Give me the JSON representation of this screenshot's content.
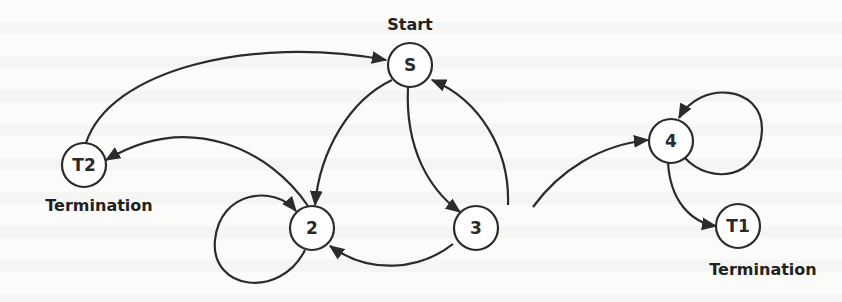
{
  "diagram": {
    "type": "state-transition",
    "colors": {
      "line": "#2b2b2b",
      "background": "#fbfbfa",
      "node_fill": "#ffffff"
    },
    "nodes": [
      {
        "id": "S",
        "label": "S",
        "caption": "Start",
        "caption_position": "above"
      },
      {
        "id": "T2",
        "label": "T2",
        "caption": "Termination",
        "caption_position": "below"
      },
      {
        "id": "2",
        "label": "2",
        "caption": null
      },
      {
        "id": "3",
        "label": "3",
        "caption": null
      },
      {
        "id": "4",
        "label": "4",
        "caption": null
      },
      {
        "id": "T1",
        "label": "T1",
        "caption": "Termination",
        "caption_position": "below"
      }
    ],
    "edges": [
      {
        "from": "T2",
        "to": "S"
      },
      {
        "from": "S",
        "to": "2"
      },
      {
        "from": "S",
        "to": "3"
      },
      {
        "from": "3",
        "to": "S"
      },
      {
        "from": "2",
        "to": "T2"
      },
      {
        "from": "2",
        "to": "2"
      },
      {
        "from": "3",
        "to": "2"
      },
      {
        "from": "3",
        "to": "4"
      },
      {
        "from": "4",
        "to": "4"
      },
      {
        "from": "4",
        "to": "T1"
      }
    ]
  }
}
